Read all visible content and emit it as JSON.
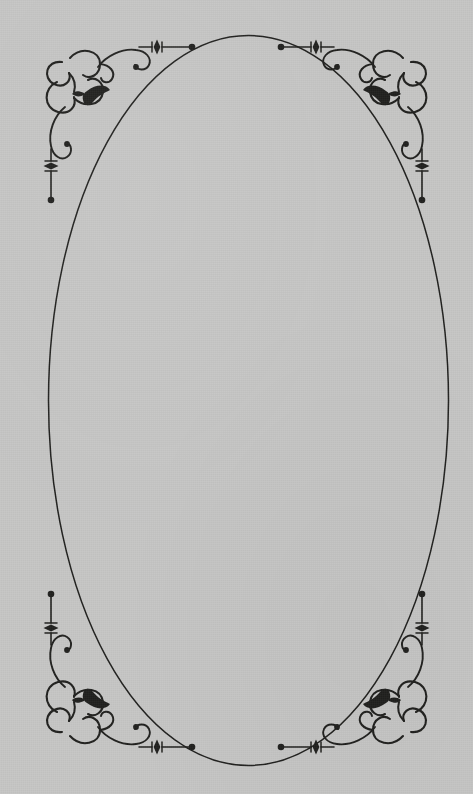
{
  "canvas": {
    "width": 473,
    "height": 794,
    "background_color": "#c5c5c4",
    "ink_color": "#20201e",
    "description": "Decorative printed page border: a tall plain ellipse centered on a gray paper ground, with a filigree corner ornament in each of the four corners."
  },
  "ellipse": {
    "name": "oval-frame",
    "center_x": 248.5,
    "center_y": 400.5,
    "radius_x": 200,
    "radius_y": 365,
    "stroke_color": "#20201e",
    "stroke_width": 1.5,
    "fill": "none",
    "top_y": 35,
    "bottom_y": 766,
    "left_x": 48,
    "right_x": 449
  },
  "ornaments": {
    "stroke_color": "#20201e",
    "count": 4,
    "corners": [
      {
        "id": "top-left",
        "name": "corner-ornament-top-left",
        "anchor_x": 40,
        "anchor_y": 36,
        "flip_x": 1,
        "flip_y": 1
      },
      {
        "id": "top-right",
        "name": "corner-ornament-top-right",
        "anchor_x": 433,
        "anchor_y": 36,
        "flip_x": -1,
        "flip_y": 1
      },
      {
        "id": "bottom-left",
        "name": "corner-ornament-bottom-left",
        "anchor_x": 40,
        "anchor_y": 758,
        "flip_x": 1,
        "flip_y": -1
      },
      {
        "id": "bottom-right",
        "name": "corner-ornament-bottom-right",
        "anchor_x": 433,
        "anchor_y": 758,
        "flip_x": -1,
        "flip_y": -1
      }
    ],
    "parts": [
      {
        "id": "quatrefoil",
        "name": "quatrefoil-cluster",
        "description": "Cluster of four overlapping rounded lobes forming a cloverleaf knot at the corner."
      },
      {
        "id": "leaf",
        "name": "leaf-accent",
        "description": "Small solid dark leaf / teardrop accent tucked inside the cluster."
      },
      {
        "id": "horizontal-flourish",
        "name": "horizontal-flourish",
        "description": "Scrolling curl running inward along the top edge, ending in a straight rule with a diamond bead and a round terminal dot.",
        "terminal_dot_x": 152,
        "terminal_dot_y": 46
      },
      {
        "id": "vertical-flourish",
        "name": "vertical-flourish",
        "description": "Scrolling curl running downward along the left edge, ending in a straight rule with a diamond bead and a round terminal dot.",
        "terminal_dot_x": 52,
        "terminal_dot_y": 144
      }
    ]
  }
}
